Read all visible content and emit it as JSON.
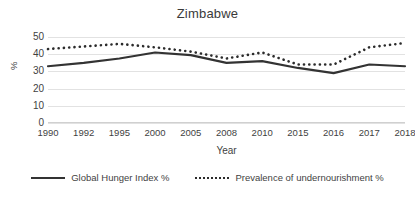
{
  "chart_data": {
    "type": "line",
    "title": "Zimbabwe",
    "xlabel": "Year",
    "ylabel": "%",
    "categories": [
      "1990",
      "1992",
      "1995",
      "2000",
      "2005",
      "2008",
      "2010",
      "2015",
      "2016",
      "2017",
      "2018"
    ],
    "ylim": [
      0,
      50
    ],
    "yticks": [
      "0",
      "10",
      "20",
      "30",
      "40",
      "50"
    ],
    "grid": true,
    "legend_position": "bottom",
    "series": [
      {
        "name": "Global Hunger Index %",
        "style": "solid",
        "color": "#333333",
        "values": [
          33,
          35,
          37.5,
          41,
          39.5,
          35,
          36,
          32,
          29,
          34,
          33
        ]
      },
      {
        "name": "Prevalence of undernourishment %",
        "style": "dotted",
        "color": "#2b2b2b",
        "values": [
          43,
          44.5,
          46,
          44,
          41.5,
          37.5,
          41,
          34,
          34,
          44,
          46.5
        ]
      }
    ]
  },
  "legend": {
    "entries": [
      {
        "label": "Global Hunger Index %"
      },
      {
        "label": "Prevalence of undernourishment %"
      }
    ]
  }
}
